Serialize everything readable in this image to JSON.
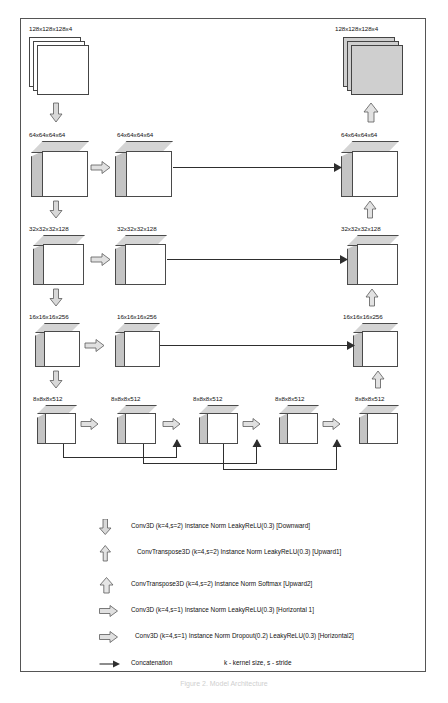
{
  "figure": {
    "caption": "Figure 2.  Model Architecture",
    "frame_border_color": "#555555"
  },
  "diagram": {
    "type": "3D U-Net encoder-decoder architecture",
    "title": "",
    "levels": [
      {
        "id": "level-input",
        "shape_label": "128x128x128x4",
        "encoder_label": "128x128x128x4",
        "decoder_label": "128x128x128x4",
        "block_kind": "slab-stack",
        "encoder_fill": "white",
        "decoder_fill": "gray"
      },
      {
        "id": "level-64",
        "shape_label": "64x64x64x64",
        "encoder_label": "64x64x64x64",
        "middle_label": "64x64x64x64",
        "decoder_label": "64x64x64x64",
        "block_kind": "cube",
        "cube_size": 46,
        "skip_connection": true
      },
      {
        "id": "level-32",
        "shape_label": "32x32x32x128",
        "encoder_label": "32x32x32x128",
        "middle_label": "32x32x32x128",
        "decoder_label": "32x32x32x128",
        "block_kind": "cube",
        "cube_size": 40,
        "skip_connection": true
      },
      {
        "id": "level-16",
        "shape_label": "16x16x16x256",
        "encoder_label": "16x16x16x256",
        "middle_label": "16x16x16x256",
        "decoder_label": "16x16x16x256",
        "block_kind": "cube",
        "cube_size": 34,
        "skip_connection": true
      }
    ],
    "bottleneck": {
      "id": "level-8-bottleneck",
      "shape_label": "8x8x8x512",
      "block_count": 5,
      "labels": [
        "8x8x8x512",
        "8x8x8x512",
        "8x8x8x512",
        "8x8x8x512",
        "8x8x8x512"
      ],
      "cube_size": 30,
      "skip_connections": 3
    }
  },
  "legend": {
    "rows": [
      {
        "icon": "down-block-arrow-icon",
        "text": "Conv3D (k=4,s=2)  Instance Norm  LeakyReLU(0.3) [Downward]"
      },
      {
        "icon": "up-thin-block-arrow-icon",
        "text": "ConvTranspose3D (k=4,s=2)  Instance Norm  LeakyReLU(0.3)  [Upward1]"
      },
      {
        "icon": "up-wide-block-arrow-icon",
        "text": "ConvTranspose3D (k=4,s=2)  Instance Norm  Softmax [Upward2]"
      },
      {
        "icon": "right-block-arrow-icon",
        "text": "Conv3D (k=4,s=1)  Instance Norm  LeakyReLU(0.3) [Horizontal 1]"
      },
      {
        "icon": "right-block-arrow-icon",
        "text": "Conv3D (k=4,s=1)  Instance Norm  Dropout(0.2)  LeakyReLU(0.3) [Horizontal2]"
      },
      {
        "icon": "line-arrow-icon",
        "text": "Concatenation",
        "note": "k - kernel size,  s - stride"
      }
    ]
  }
}
